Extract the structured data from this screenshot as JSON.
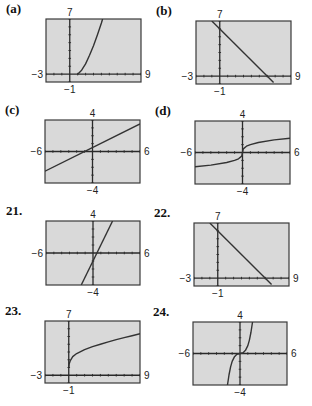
{
  "chart_data": [
    {
      "id": "a",
      "label": "(a)",
      "type": "line",
      "window": {
        "xmin": -3,
        "xmax": 9,
        "ymin": -1,
        "ymax": 7
      },
      "labels": {
        "top": "7",
        "bottom": "−1",
        "left": "−3",
        "right": "9"
      },
      "curve": "sqrt-inverse",
      "description": "increasing curve starting near (1,0), rising steeply (x^2-type right branch)",
      "points": [
        [
          1.0,
          0
        ],
        [
          1.5,
          0.5
        ],
        [
          2,
          1.3
        ],
        [
          2.5,
          2.4
        ],
        [
          3,
          3.6
        ],
        [
          3.5,
          5
        ],
        [
          4,
          6.5
        ],
        [
          4.15,
          7
        ]
      ],
      "box": {
        "x": 46,
        "y": 19,
        "w": 95,
        "h": 63
      }
    },
    {
      "id": "b",
      "label": "(b)",
      "type": "line",
      "window": {
        "xmin": -3,
        "xmax": 9,
        "ymin": -1,
        "ymax": 7
      },
      "labels": {
        "top": "7",
        "bottom": "−1",
        "left": "−3",
        "right": "9"
      },
      "description": "decreasing line, y-intercept about 6, x-intercept about 6",
      "points": [
        [
          -1,
          7
        ],
        [
          6.8,
          -0.8
        ]
      ],
      "box": {
        "x": 196,
        "y": 21,
        "w": 95,
        "h": 63
      }
    },
    {
      "id": "c",
      "label": "(c)",
      "type": "line",
      "window": {
        "xmin": -6,
        "xmax": 6,
        "ymin": -4,
        "ymax": 4
      },
      "labels": {
        "top": "4",
        "bottom": "−4",
        "left": "−6",
        "right": "6"
      },
      "description": "increasing line with slope 1/2 passing near (-1,0)",
      "points": [
        [
          -6,
          -2.5
        ],
        [
          6,
          3.5
        ]
      ],
      "box": {
        "x": 45,
        "y": 120,
        "w": 95,
        "h": 63
      }
    },
    {
      "id": "d",
      "label": "(d)",
      "type": "line",
      "window": {
        "xmin": -6,
        "xmax": 6,
        "ymin": -4,
        "ymax": 4
      },
      "labels": {
        "top": "4",
        "bottom": "−4",
        "left": "−6",
        "right": "6"
      },
      "description": "cube-root shaped curve through origin",
      "points": [
        [
          -6,
          -1.8
        ],
        [
          -4,
          -1.6
        ],
        [
          -2,
          -1.27
        ],
        [
          -1,
          -1.0
        ],
        [
          -0.5,
          -0.8
        ],
        [
          -0.1,
          -0.46
        ],
        [
          0,
          0
        ],
        [
          0.1,
          0.46
        ],
        [
          0.5,
          0.8
        ],
        [
          1,
          1.0
        ],
        [
          2,
          1.27
        ],
        [
          4,
          1.6
        ],
        [
          6,
          1.8
        ]
      ],
      "box": {
        "x": 195,
        "y": 121,
        "w": 95,
        "h": 63
      }
    },
    {
      "id": "21",
      "label": "21.",
      "type": "line",
      "window": {
        "xmin": -6,
        "xmax": 6,
        "ymin": -4,
        "ymax": 4
      },
      "labels": {
        "top": "4",
        "bottom": "−4",
        "left": "−6",
        "right": "6"
      },
      "description": "steep increasing line, slope 2, y-intercept -1",
      "points": [
        [
          -1.5,
          -4
        ],
        [
          2.5,
          4
        ]
      ],
      "box": {
        "x": 46,
        "y": 221,
        "w": 94,
        "h": 64
      }
    },
    {
      "id": "22",
      "label": "22.",
      "type": "line",
      "window": {
        "xmin": -3,
        "xmax": 9,
        "ymin": -1,
        "ymax": 7
      },
      "labels": {
        "top": "7",
        "bottom": "−1",
        "left": "−3",
        "right": "9"
      },
      "description": "decreasing line, y-intercept about 6, x-intercept about 6",
      "points": [
        [
          -1,
          7
        ],
        [
          6.8,
          -0.8
        ]
      ],
      "box": {
        "x": 194,
        "y": 223,
        "w": 95,
        "h": 63
      }
    },
    {
      "id": "23",
      "label": "23.",
      "type": "line",
      "window": {
        "xmin": -3,
        "xmax": 9,
        "ymin": -1,
        "ymax": 7
      },
      "labels": {
        "top": "7",
        "bottom": "−1",
        "left": "−3",
        "right": "9"
      },
      "description": "square-root curve starting at (0,1) increasing",
      "points": [
        [
          0,
          1
        ],
        [
          0.05,
          1.45
        ],
        [
          0.2,
          1.9
        ],
        [
          0.5,
          2.4
        ],
        [
          1,
          2.8
        ],
        [
          2,
          3.3
        ],
        [
          3,
          3.7
        ],
        [
          4,
          4.0
        ],
        [
          5,
          4.3
        ],
        [
          6,
          4.6
        ],
        [
          7,
          4.85
        ],
        [
          8,
          5.1
        ],
        [
          9,
          5.35
        ]
      ],
      "box": {
        "x": 45,
        "y": 321,
        "w": 95,
        "h": 62
      }
    },
    {
      "id": "24",
      "label": "24.",
      "type": "line",
      "window": {
        "xmin": -6,
        "xmax": 6,
        "ymin": -4,
        "ymax": 4
      },
      "labels": {
        "top": "4",
        "bottom": "−4",
        "left": "−6",
        "right": "6"
      },
      "description": "cubic curve through origin",
      "points": [
        [
          -1.6,
          -4
        ],
        [
          -1.4,
          -2.7
        ],
        [
          -1.2,
          -1.7
        ],
        [
          -1,
          -1.0
        ],
        [
          -0.7,
          -0.4
        ],
        [
          -0.4,
          -0.1
        ],
        [
          0,
          0
        ],
        [
          0.4,
          0.1
        ],
        [
          0.7,
          0.4
        ],
        [
          1,
          1.0
        ],
        [
          1.2,
          1.7
        ],
        [
          1.4,
          2.7
        ],
        [
          1.6,
          4
        ]
      ],
      "box": {
        "x": 193,
        "y": 322,
        "w": 94,
        "h": 63
      }
    }
  ],
  "style": {
    "screen_bg": "#d9d9d9",
    "frame_color": "#3a3a3a",
    "axis_color": "#2a2a2a",
    "curve_color": "#333333"
  }
}
